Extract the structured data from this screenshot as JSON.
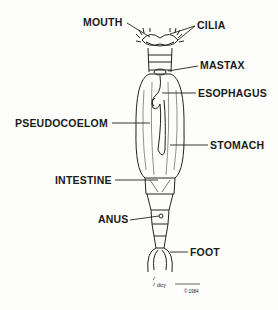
{
  "diagram": {
    "labels": {
      "mouth": "MOUTH",
      "cilia": "CILIA",
      "mastax": "MASTAX",
      "esophagus": "ESOPHAGUS",
      "pseudocoelom": "PSEUDOCOELOM",
      "stomach": "STOMACH",
      "intestine": "INTESTINE",
      "anus": "ANUS",
      "foot": "FOOT"
    },
    "signature": "© 1984",
    "colors": {
      "ink": "#1a1a1a",
      "background": "#fdfdfb"
    }
  }
}
